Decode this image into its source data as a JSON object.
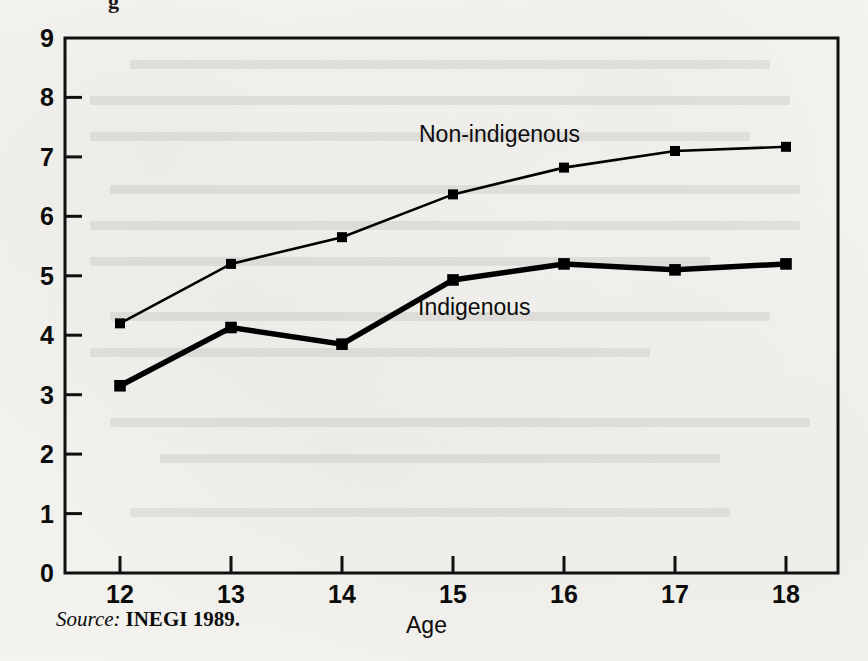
{
  "figure": {
    "source_prefix": "Source:",
    "source_reference": "INEGI 1989.",
    "clipped_title_fragment": "g"
  },
  "chart_data": {
    "type": "line",
    "title": "",
    "xlabel": "Age",
    "ylabel": "",
    "x": [
      12,
      13,
      14,
      15,
      16,
      17,
      18
    ],
    "categories": [
      "12",
      "13",
      "14",
      "15",
      "16",
      "17",
      "18"
    ],
    "xtick_labels": [
      "12",
      "13",
      "14",
      "15",
      "16",
      "17",
      "18"
    ],
    "ytick_labels": [
      "0",
      "1",
      "2",
      "3",
      "4",
      "5",
      "6",
      "7",
      "8",
      "9"
    ],
    "xlim": [
      11.5,
      18.5
    ],
    "ylim": [
      0,
      9
    ],
    "grid": false,
    "legend_position": "inline-annotation",
    "series": [
      {
        "name": "Non-indigenous",
        "label_text": "Non-indigenous",
        "values": [
          4.2,
          5.2,
          5.65,
          6.37,
          6.82,
          7.1,
          7.17
        ],
        "line_width": 2,
        "color": "#000000",
        "marker": "square"
      },
      {
        "name": "Indigenous",
        "label_text": "Indigenous",
        "values": [
          3.15,
          4.13,
          3.85,
          4.93,
          5.2,
          5.1,
          5.2
        ],
        "line_width": 5,
        "color": "#000000",
        "marker": "square"
      }
    ],
    "annotations": [
      {
        "text": "Non-indigenous",
        "x_px": 419,
        "y_px": 121
      },
      {
        "text": "Indigenous",
        "x_px": 418,
        "y_px": 294
      }
    ]
  }
}
